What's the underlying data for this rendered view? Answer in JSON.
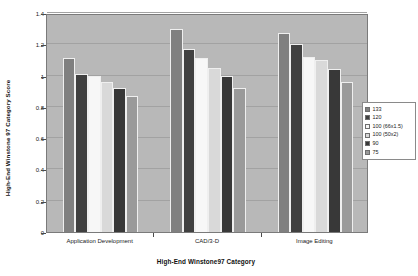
{
  "chart_data": {
    "type": "bar",
    "title": "",
    "xlabel": "High-End Winstone97 Category",
    "ylabel": "High-End Winstone 97 Category Score",
    "categories": [
      "Application Development",
      "CAD/3-D",
      "Image Editing"
    ],
    "ylim": [
      0,
      1.4
    ],
    "yticks": [
      0,
      0.2,
      0.4,
      0.6,
      0.8,
      1,
      1.2,
      1.4
    ],
    "ytick_labels": [
      "0",
      "0.2",
      "0.4",
      "0.6",
      "0.8",
      "1",
      "1.2",
      "1.4"
    ],
    "grid": true,
    "legend_position": "right",
    "series": [
      {
        "name": "133",
        "color": "#808080",
        "values": [
          1.11,
          1.3,
          1.27
        ]
      },
      {
        "name": "120",
        "color": "#404040",
        "values": [
          1.01,
          1.17,
          1.2
        ]
      },
      {
        "name": "100 (66x1.5)",
        "color": "#f7f7f7",
        "values": [
          1.0,
          1.11,
          1.12
        ]
      },
      {
        "name": "100 (50x2)",
        "color": "#d9d9d9",
        "values": [
          0.96,
          1.05,
          1.1
        ]
      },
      {
        "name": "90",
        "color": "#383838",
        "values": [
          0.92,
          1.0,
          1.04
        ]
      },
      {
        "name": "75",
        "color": "#9a9a9a",
        "values": [
          0.87,
          0.92,
          0.96
        ]
      }
    ]
  },
  "legend": {
    "items": [
      {
        "label": "133"
      },
      {
        "label": "120"
      },
      {
        "label": "100 (66x1.5)"
      },
      {
        "label": "100 (50x2)"
      },
      {
        "label": "90"
      },
      {
        "label": "75"
      }
    ]
  }
}
